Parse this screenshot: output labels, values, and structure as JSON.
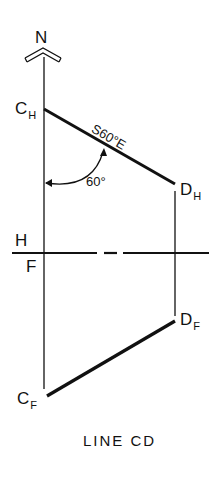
{
  "north_arrow": {
    "label": "N"
  },
  "points": {
    "c_h": {
      "letter": "C",
      "sub": "H"
    },
    "d_h": {
      "letter": "D",
      "sub": "H"
    },
    "d_f": {
      "letter": "D",
      "sub": "F"
    },
    "c_f": {
      "letter": "C",
      "sub": "F"
    }
  },
  "fold_line": {
    "top_label": "H",
    "bottom_label": "F"
  },
  "bearing_label": "S60°E",
  "angle_label": "60°",
  "caption": "LINE CD",
  "colors": {
    "ink": "#111111",
    "background": "#ffffff"
  }
}
